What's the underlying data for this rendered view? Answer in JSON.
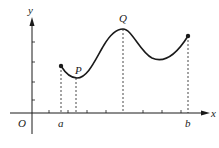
{
  "diagram": {
    "type": "function-graph",
    "labels": {
      "y_axis": "y",
      "x_axis": "x",
      "origin": "O",
      "a": "a",
      "b": "b",
      "P": "P",
      "Q": "Q"
    },
    "colors": {
      "ink": "#1a1a1a",
      "background": "#ffffff"
    },
    "points": {
      "start": {
        "label": "a",
        "marker": "filled-dot"
      },
      "P": {
        "label": "P",
        "kind": "local minimum"
      },
      "Q": {
        "label": "Q",
        "kind": "local maximum"
      },
      "end": {
        "label": "b",
        "marker": "filled-dot"
      }
    }
  }
}
